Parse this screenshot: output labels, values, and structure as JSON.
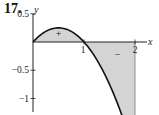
{
  "problem_number": "17.",
  "chart_data": {
    "type": "area",
    "title": "",
    "xlabel": "x",
    "ylabel": "y",
    "function": "y = x - x^2",
    "x_range": [
      0,
      2
    ],
    "xlim": [
      0,
      2.2
    ],
    "ylim": [
      -2.3,
      0.75
    ],
    "x_ticks": [
      1,
      2
    ],
    "x_tick_labels": [
      "1",
      "2"
    ],
    "y_ticks": [
      0.5,
      -0.5,
      -1,
      -1.5,
      -2
    ],
    "y_tick_labels": [
      "0.5",
      "−0.5",
      "−1",
      "−1.5",
      "−2"
    ],
    "points": [
      {
        "x": 0,
        "y": 0
      },
      {
        "x": 0.25,
        "y": 0.1875
      },
      {
        "x": 0.5,
        "y": 0.25
      },
      {
        "x": 0.75,
        "y": 0.1875
      },
      {
        "x": 1,
        "y": 0
      },
      {
        "x": 1.25,
        "y": -0.3125
      },
      {
        "x": 1.5,
        "y": -0.75
      },
      {
        "x": 1.75,
        "y": -1.3125
      },
      {
        "x": 2,
        "y": -2
      }
    ],
    "shaded_regions": [
      {
        "x_from": 0,
        "x_to": 1,
        "sign_label": "+"
      },
      {
        "x_from": 1,
        "x_to": 2,
        "sign_label": "−"
      }
    ],
    "grid": false,
    "fill_color": "#d4d4d4",
    "curve_color": "#111111"
  }
}
